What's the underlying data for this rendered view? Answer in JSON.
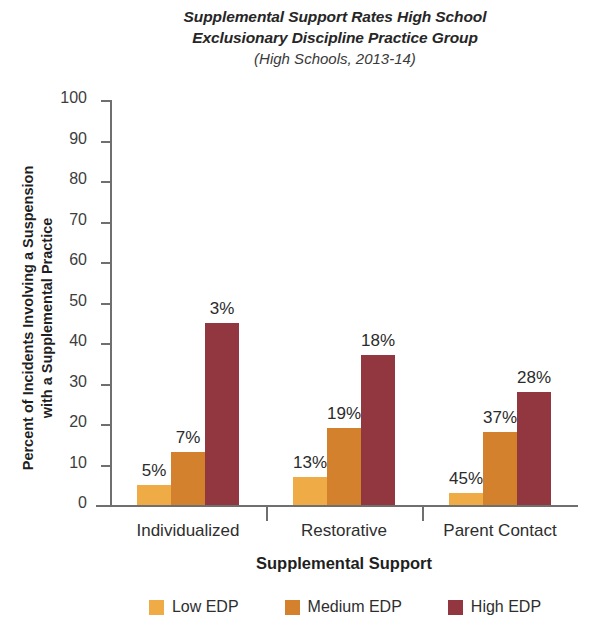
{
  "chart_data": {
    "type": "bar",
    "title": "Supplemental Support Rates High School Exclusionary Discipline Practice Group",
    "title_lines": [
      "Supplemental Support Rates High School",
      "Exclusionary Discipline Practice Group"
    ],
    "subtitle": "(High Schools, 2013-14)",
    "xlabel": "Supplemental Support",
    "ylabel": "Percent of Incidents Involving a Suspension with a Supplemental Practice",
    "ylabel_lines": [
      "Percent of Incidents Involving a Suspension",
      "with a Supplemental Practice"
    ],
    "categories": [
      "Individualized",
      "Restorative",
      "Parent Contact"
    ],
    "series": [
      {
        "name": "Low EDP",
        "color": "#efab45",
        "values": [
          5,
          7,
          3
        ]
      },
      {
        "name": "Medium EDP",
        "color": "#d4812d",
        "values": [
          13,
          19,
          18
        ]
      },
      {
        "name": "High EDP",
        "color": "#92363f",
        "values": [
          45,
          37,
          28
        ]
      }
    ],
    "series_by_group": [
      {
        "category": "Individualized",
        "values": [
          5,
          7,
          3
        ]
      },
      {
        "category": "Restorative",
        "values": [
          13,
          19,
          18
        ]
      },
      {
        "category": "Parent Contact",
        "values": [
          45,
          37,
          28
        ]
      }
    ],
    "data_labels": [
      [
        "5%",
        "7%",
        "3%"
      ],
      [
        "13%",
        "19%",
        "18%"
      ],
      [
        "45%",
        "37%",
        "28%"
      ]
    ],
    "ylim": [
      0,
      100
    ],
    "yticks": [
      100,
      90,
      80,
      70,
      60,
      50,
      40,
      30,
      20,
      10,
      0
    ],
    "ytick_labels": [
      "100",
      "90",
      "80",
      "70",
      "60",
      "50",
      "40",
      "30",
      "20",
      "10",
      "0"
    ],
    "grid": false,
    "legend_position": "bottom",
    "value_suffix": "%"
  },
  "legend": {
    "items": [
      {
        "label": "Low EDP",
        "color": "#efab45"
      },
      {
        "label": "Medium EDP",
        "color": "#d4812d"
      },
      {
        "label": "High EDP",
        "color": "#92363f"
      }
    ]
  }
}
